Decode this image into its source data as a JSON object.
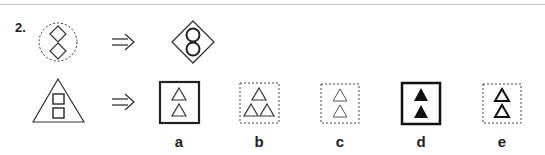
{
  "question": {
    "number": "2.",
    "analogy": {
      "source": {
        "shape": "dashed-circle",
        "contains": [
          "diamond",
          "diamond"
        ]
      },
      "result": {
        "shape": "solid-diamond",
        "contains": [
          "circle",
          "circle"
        ]
      },
      "arrow": "implies-arrow"
    },
    "prompt": {
      "shape": "solid-triangle",
      "contains": [
        "square",
        "square"
      ]
    },
    "options": [
      {
        "label": "a",
        "frame": "solid-thick-square",
        "contains": "2 outline triangles"
      },
      {
        "label": "b",
        "frame": "dashed-square",
        "contains": "3 outline triangles"
      },
      {
        "label": "c",
        "frame": "dashed-square",
        "contains": "2 thin outline triangles"
      },
      {
        "label": "d",
        "frame": "solid-thick-square",
        "contains": "2 filled triangles"
      },
      {
        "label": "e",
        "frame": "dashed-square",
        "contains": "2 thick outline triangles"
      }
    ]
  }
}
